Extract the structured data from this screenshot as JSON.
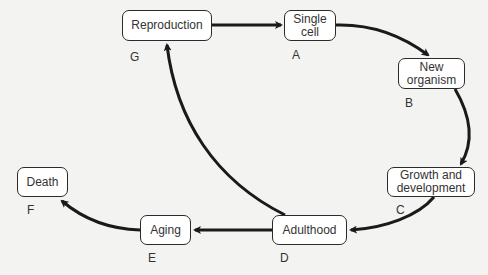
{
  "diagram": {
    "type": "life-cycle flow",
    "nodes": [
      {
        "id": "reproduction",
        "text": "Reproduction",
        "letter": "G"
      },
      {
        "id": "single-cell",
        "text": "Single\ncell",
        "letter": "A"
      },
      {
        "id": "new-organism",
        "text": "New\norganism",
        "letter": "B"
      },
      {
        "id": "growth",
        "text": "Growth and\ndevelopment",
        "letter": "C"
      },
      {
        "id": "adulthood",
        "text": "Adulthood",
        "letter": "D"
      },
      {
        "id": "aging",
        "text": "Aging",
        "letter": "E"
      },
      {
        "id": "death",
        "text": "Death",
        "letter": "F"
      }
    ],
    "edges": [
      {
        "from": "Reproduction",
        "to": "Single cell"
      },
      {
        "from": "Single cell",
        "to": "New organism"
      },
      {
        "from": "New organism",
        "to": "Growth and development"
      },
      {
        "from": "Growth and development",
        "to": "Adulthood"
      },
      {
        "from": "Adulthood",
        "to": "Aging"
      },
      {
        "from": "Adulthood",
        "to": "Reproduction"
      },
      {
        "from": "Aging",
        "to": "Death"
      }
    ]
  },
  "colors": {
    "background": "#f3f3f1",
    "box_fill": "#ffffff",
    "stroke": "#1a1a1a"
  }
}
